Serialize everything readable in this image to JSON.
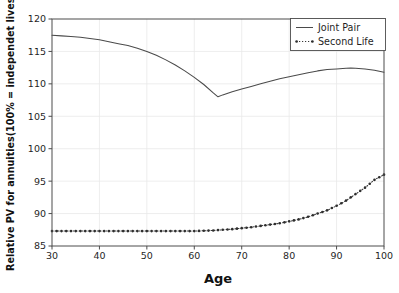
{
  "chart_data": {
    "type": "line",
    "title": "",
    "xlabel": "Age",
    "ylabel": "Relative PV for annuities(100% = independet lives)",
    "xlim": [
      30,
      100
    ],
    "ylim": [
      85,
      120
    ],
    "xticks": [
      30,
      40,
      50,
      60,
      70,
      80,
      90,
      100
    ],
    "yticks": [
      85,
      90,
      95,
      100,
      105,
      110,
      115,
      120
    ],
    "grid": true,
    "legend_position": "upper right",
    "series": [
      {
        "name": "Joint Pair",
        "style": "solid",
        "marker": "none",
        "color": "#4a4a4a",
        "x": [
          30,
          32,
          34,
          36,
          38,
          40,
          42,
          44,
          46,
          48,
          50,
          52,
          54,
          56,
          58,
          60,
          62,
          64,
          65,
          66,
          68,
          70,
          72,
          74,
          76,
          78,
          80,
          82,
          84,
          86,
          88,
          90,
          92,
          93,
          94,
          96,
          98,
          100
        ],
        "values": [
          117.5,
          117.4,
          117.3,
          117.2,
          117.0,
          116.8,
          116.5,
          116.2,
          115.9,
          115.5,
          115.0,
          114.4,
          113.7,
          112.9,
          112.0,
          111.0,
          109.9,
          108.6,
          108.0,
          108.3,
          108.8,
          109.2,
          109.6,
          110.0,
          110.4,
          110.8,
          111.1,
          111.4,
          111.7,
          112.0,
          112.2,
          112.3,
          112.4,
          112.45,
          112.4,
          112.3,
          112.1,
          111.8
        ]
      },
      {
        "name": "Second Life",
        "style": "dotted",
        "marker": "dot",
        "color": "#2e2e2e",
        "x": [
          30,
          32,
          34,
          36,
          38,
          40,
          42,
          44,
          46,
          48,
          50,
          52,
          54,
          56,
          58,
          60,
          62,
          64,
          66,
          68,
          70,
          72,
          74,
          76,
          78,
          80,
          82,
          84,
          86,
          88,
          90,
          92,
          94,
          96,
          98,
          99,
          100
        ],
        "values": [
          87.3,
          87.3,
          87.3,
          87.3,
          87.3,
          87.3,
          87.3,
          87.3,
          87.3,
          87.3,
          87.3,
          87.3,
          87.3,
          87.3,
          87.3,
          87.3,
          87.35,
          87.4,
          87.5,
          87.6,
          87.75,
          87.9,
          88.1,
          88.3,
          88.5,
          88.8,
          89.1,
          89.5,
          90.0,
          90.5,
          91.2,
          92.0,
          93.0,
          94.0,
          95.2,
          95.6,
          96.0
        ]
      }
    ]
  },
  "legend": {
    "entries": [
      {
        "label": "Joint Pair"
      },
      {
        "label": "Second Life"
      }
    ]
  },
  "axes": {
    "x_title": "Age",
    "y_title": "Relative PV for annuities(100% = independet lives)",
    "x_tick_labels": [
      "30",
      "40",
      "50",
      "60",
      "70",
      "80",
      "90",
      "100"
    ],
    "y_tick_labels": [
      "85",
      "90",
      "95",
      "100",
      "105",
      "110",
      "115",
      "120"
    ]
  }
}
